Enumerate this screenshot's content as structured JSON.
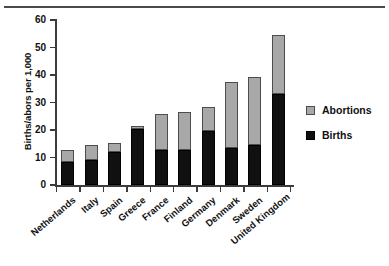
{
  "chart_data": {
    "type": "bar",
    "subtype": "stacked-vertical",
    "title": "",
    "xlabel": "",
    "ylabel": "Births/abors per 1,000",
    "ylim": [
      0,
      60
    ],
    "yticks": [
      0,
      10,
      20,
      30,
      40,
      50,
      60
    ],
    "ytick_labels": [
      "0",
      "10",
      "20",
      "30",
      "40",
      "50",
      "60"
    ],
    "grid": false,
    "legend_position": "right",
    "categories": [
      "Netherlands",
      "Italy",
      "Spain",
      "Greece",
      "France",
      "Finland",
      "Germany",
      "Denmark",
      "Sweden",
      "United Kingdom"
    ],
    "series": [
      {
        "name": "Births",
        "color": "#101010",
        "values": [
          8.5,
          9.0,
          12.0,
          20.3,
          12.8,
          12.8,
          19.5,
          13.5,
          14.5,
          33.0
        ]
      },
      {
        "name": "Abortions",
        "color": "#a8a8a8",
        "values": [
          4.3,
          5.5,
          3.3,
          1.2,
          13.2,
          13.7,
          9.0,
          24.0,
          24.8,
          21.5
        ]
      }
    ],
    "totals": [
      12.8,
      14.5,
      15.3,
      21.5,
      26.0,
      26.5,
      28.5,
      37.5,
      39.3,
      54.5
    ]
  },
  "legend": {
    "items": [
      {
        "label": "Abortions",
        "swatch": "gray-square-swatch"
      },
      {
        "label": "Births",
        "swatch": "black-square-swatch"
      }
    ]
  }
}
